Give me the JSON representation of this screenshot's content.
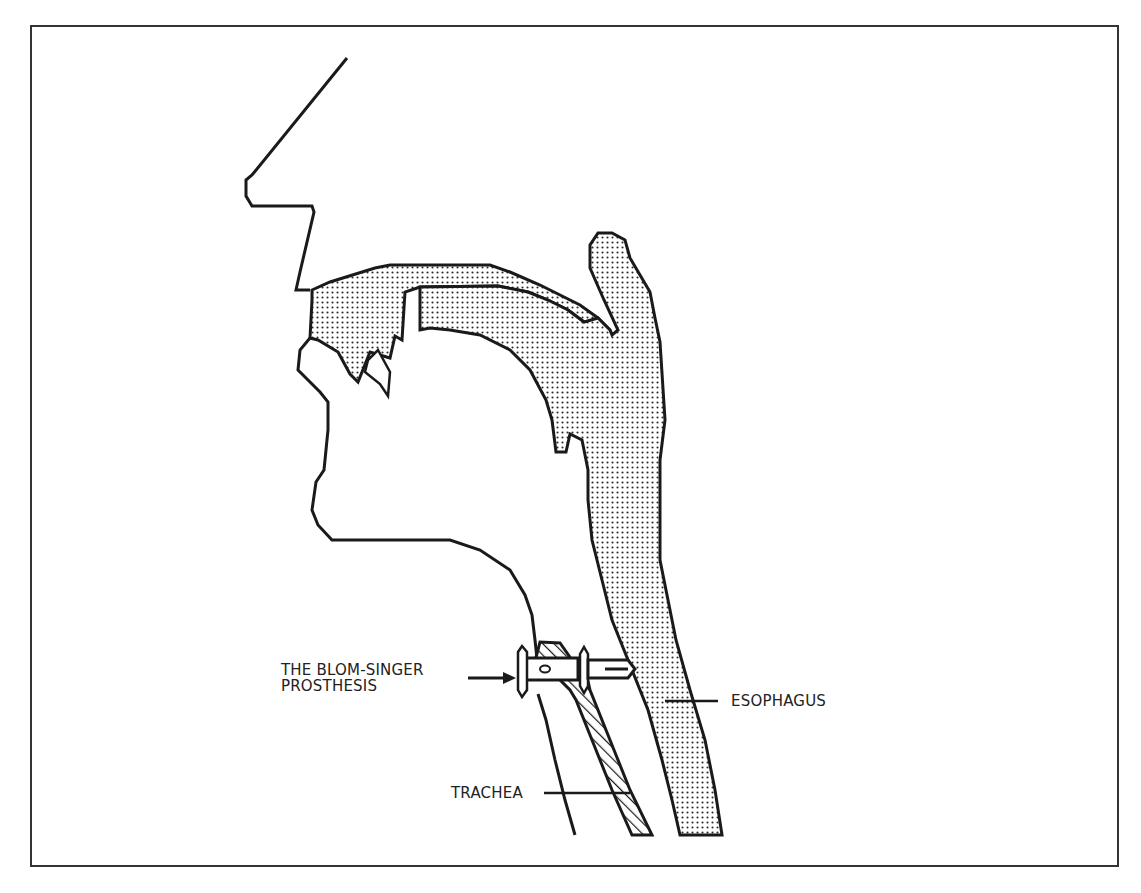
{
  "figure": {
    "labels": {
      "prosthesis_line1": "THE BLOM-SINGER",
      "prosthesis_line2": "PROSTHESIS",
      "esophagus": "ESOPHAGUS",
      "trachea": "TRACHEA"
    },
    "colors": {
      "outline": "#1a1a1a",
      "frame": "#333333",
      "stipple": "#2a2a2a",
      "background": "#ffffff"
    }
  }
}
